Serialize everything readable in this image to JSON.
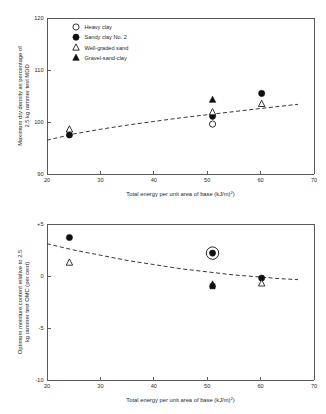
{
  "figure": {
    "background": "#ffffff",
    "marker_color": "#111111",
    "axis_color": "#5a5a5a",
    "trend_color": "#1f1f1f"
  },
  "legend": {
    "position": "top-left-inside",
    "entries": [
      {
        "label": "Heavy clay",
        "marker": "open-circle"
      },
      {
        "label": "Sandy clay No. 2",
        "marker": "filled-circle"
      },
      {
        "label": "Well-graded sand",
        "marker": "open-triangle"
      },
      {
        "label": "Gravel-sand-clay",
        "marker": "filled-triangle"
      }
    ]
  },
  "chart_data": [
    {
      "id": "top",
      "type": "scatter",
      "title": "",
      "xlabel": "Total energy per unit area of base (kJ/m²)",
      "ylabel": "Maximum dry density as percentage of 2.5 kg rammer test MDD",
      "xlim": [
        20,
        70
      ],
      "ylim": [
        90,
        120
      ],
      "xticks": [
        20,
        30,
        40,
        50,
        60,
        70
      ],
      "yticks": [
        90,
        100,
        110,
        120
      ],
      "grid": false,
      "legend_position": "upper left",
      "series": [
        {
          "name": "Heavy clay",
          "marker": "open-circle",
          "points": [
            {
              "x": 51,
              "y": 99.6
            }
          ]
        },
        {
          "name": "Sandy clay No. 2",
          "marker": "filled-circle",
          "points": [
            {
              "x": 24.2,
              "y": 97.5
            },
            {
              "x": 51,
              "y": 101.1
            },
            {
              "x": 60.2,
              "y": 105.5
            }
          ]
        },
        {
          "name": "Well-graded sand",
          "marker": "open-triangle",
          "points": [
            {
              "x": 24.2,
              "y": 98.6
            },
            {
              "x": 51,
              "y": 101.9
            },
            {
              "x": 60.2,
              "y": 103.5
            }
          ]
        },
        {
          "name": "Gravel-sand-clay",
          "marker": "filled-triangle",
          "points": [
            {
              "x": 51,
              "y": 104.3
            }
          ]
        }
      ],
      "trend": {
        "style": "dashed",
        "points": [
          {
            "x": 20.0,
            "y": 96.5
          },
          {
            "x": 25.0,
            "y": 97.7
          },
          {
            "x": 30.0,
            "y": 98.6
          },
          {
            "x": 35.0,
            "y": 99.4
          },
          {
            "x": 40.0,
            "y": 100.1
          },
          {
            "x": 45.0,
            "y": 100.8
          },
          {
            "x": 50.0,
            "y": 101.4
          },
          {
            "x": 55.0,
            "y": 102.0
          },
          {
            "x": 60.0,
            "y": 102.6
          },
          {
            "x": 63.5,
            "y": 103.0
          },
          {
            "x": 67.0,
            "y": 103.4
          }
        ]
      }
    },
    {
      "id": "bottom",
      "type": "scatter",
      "title": "",
      "xlabel": "Total energy per unit area of base (kJ/m²)",
      "ylabel": "Optimum moisture content relative to 2.5 kg rammer test OMC (per cent)",
      "xlim": [
        20,
        70
      ],
      "ylim": [
        -10,
        5
      ],
      "xticks": [
        20,
        30,
        40,
        50,
        60,
        70
      ],
      "yticks": [
        -10,
        -5,
        0,
        5
      ],
      "ytick_labels": [
        "-10",
        "-5",
        "0",
        "+5"
      ],
      "grid": false,
      "legend_position": "none",
      "series": [
        {
          "name": "Sandy clay No. 2",
          "marker": "filled-circle",
          "points": [
            {
              "x": 24.2,
              "y": 3.7
            },
            {
              "x": 51,
              "y": 2.2,
              "highlighted": true
            },
            {
              "x": 60.2,
              "y": -0.2
            }
          ]
        },
        {
          "name": "Well-graded sand",
          "marker": "open-triangle",
          "points": [
            {
              "x": 24.2,
              "y": 1.3
            },
            {
              "x": 60.2,
              "y": -0.7
            }
          ]
        },
        {
          "name": "Gravel-sand-clay",
          "marker": "filled-triangle",
          "points": [
            {
              "x": 51,
              "y": -0.8
            }
          ]
        },
        {
          "name": "Heavy clay",
          "marker": "filled-square",
          "points": [
            {
              "x": 51,
              "y": -1.0
            }
          ]
        }
      ],
      "trend": {
        "style": "dashed",
        "points": [
          {
            "x": 20.0,
            "y": 3.1
          },
          {
            "x": 25.0,
            "y": 2.5
          },
          {
            "x": 30.0,
            "y": 2.0
          },
          {
            "x": 35.0,
            "y": 1.5
          },
          {
            "x": 40.0,
            "y": 1.1
          },
          {
            "x": 45.0,
            "y": 0.7
          },
          {
            "x": 50.0,
            "y": 0.4
          },
          {
            "x": 55.0,
            "y": 0.1
          },
          {
            "x": 60.0,
            "y": -0.1
          },
          {
            "x": 63.5,
            "y": -0.25
          },
          {
            "x": 67.0,
            "y": -0.35
          }
        ]
      }
    }
  ]
}
